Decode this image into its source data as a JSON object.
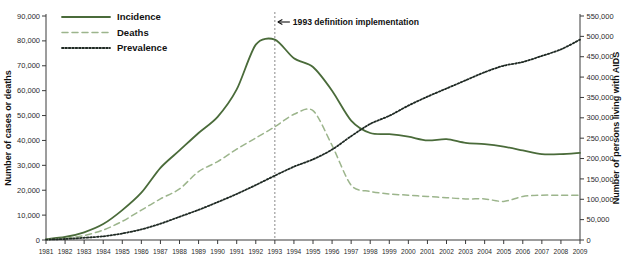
{
  "chart_data": {
    "type": "line",
    "title": "",
    "xlabel": "",
    "ylabel": "Number of cases or deaths",
    "y2label": "Number of persons living with AIDS",
    "grid": false,
    "legend_position": "top-left",
    "ylim": [
      0,
      90000
    ],
    "y2lim": [
      0,
      550000
    ],
    "yticks": [
      0,
      10000,
      20000,
      30000,
      40000,
      50000,
      60000,
      70000,
      80000,
      90000
    ],
    "ytick_labels": [
      "0",
      "10,000",
      "20,000",
      "30,000",
      "40,000",
      "50,000",
      "60,000",
      "70,000",
      "80,000",
      "90,000"
    ],
    "y2ticks": [
      0,
      50000,
      100000,
      150000,
      200000,
      250000,
      300000,
      350000,
      400000,
      450000,
      500000,
      550000
    ],
    "y2tick_labels": [
      "0",
      "50,000",
      "100,000",
      "150,000",
      "200,000",
      "250,000",
      "300,000",
      "350,000",
      "400,000",
      "450,000",
      "500,000",
      "550,000"
    ],
    "categories": [
      1981,
      1982,
      1983,
      1984,
      1985,
      1986,
      1987,
      1988,
      1989,
      1990,
      1991,
      1992,
      1993,
      1994,
      1995,
      1996,
      1997,
      1998,
      1999,
      2000,
      2001,
      2002,
      2003,
      2004,
      2005,
      2006,
      2007,
      2008,
      2009
    ],
    "x": [
      "1981",
      "1982",
      "1983",
      "1984",
      "1985",
      "1986",
      "1987",
      "1988",
      "1989",
      "1990",
      "1991",
      "1992",
      "1993",
      "1994",
      "1995",
      "1996",
      "1997",
      "1998",
      "1999",
      "2000",
      "2001",
      "2002",
      "2003",
      "2004",
      "2005",
      "2006",
      "2007",
      "2008",
      "2009"
    ],
    "series": [
      {
        "name": "Incidence",
        "axis": "left",
        "color": "#4a6b3a",
        "style": "solid",
        "values": [
          320,
          1200,
          3100,
          6400,
          12000,
          19000,
          29000,
          36000,
          43000,
          49500,
          60500,
          78500,
          80500,
          73000,
          69500,
          60000,
          48000,
          43000,
          42500,
          41500,
          40000,
          40500,
          39000,
          38500,
          37500,
          36000,
          34500,
          34500,
          35000
        ]
      },
      {
        "name": "Deaths",
        "axis": "left",
        "color": "#9cb58c",
        "style": "dashed",
        "values": [
          200,
          700,
          1800,
          4000,
          7500,
          12000,
          16500,
          20500,
          27500,
          31500,
          36500,
          41000,
          45500,
          50500,
          52000,
          38000,
          22000,
          19500,
          18500,
          18000,
          17500,
          17000,
          16500,
          16500,
          15500,
          17500,
          18000,
          18000,
          18000
        ]
      },
      {
        "name": "Prevalence",
        "axis": "right",
        "color": "#1f2a24",
        "style": "dotted",
        "values": [
          1000,
          2500,
          5500,
          9000,
          16000,
          26000,
          40000,
          57000,
          74000,
          93000,
          113000,
          135000,
          158000,
          180000,
          198000,
          222000,
          255000,
          285000,
          305000,
          330000,
          352000,
          372000,
          392000,
          412000,
          428000,
          437000,
          452000,
          468000,
          492000
        ]
      }
    ],
    "annotations": [
      {
        "name": "definition-change",
        "text": "1993 definition implementation",
        "x": "1993",
        "arrow": "left"
      }
    ],
    "legend": [
      {
        "label": "Incidence",
        "style": "solid",
        "color": "#4a6b3a"
      },
      {
        "label": "Deaths",
        "style": "dashed",
        "color": "#9cb58c"
      },
      {
        "label": "Prevalence",
        "style": "dotted",
        "color": "#1f2a24"
      }
    ]
  }
}
